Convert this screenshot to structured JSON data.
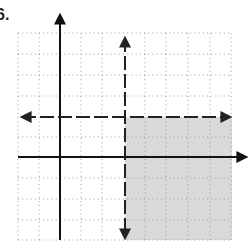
{
  "problem": {
    "label": "6."
  },
  "graph": {
    "type": "inequality-graph",
    "description": "System of linear inequalities on coordinate grid with shaded solution region",
    "grid": {
      "x_min": -2,
      "x_max": 8,
      "y_min": -4,
      "y_max": 6,
      "unit_px": 21,
      "dot_color": "#9a9a9a"
    },
    "axes": {
      "x_axis_y": 0,
      "y_axis_x": 0,
      "color": "#111111"
    },
    "boundary_lines": [
      {
        "name": "vertical-boundary",
        "equation": "x = 3",
        "style": "dashed"
      },
      {
        "name": "horizontal-boundary",
        "equation": "y = 2",
        "style": "dashed"
      }
    ],
    "shaded_region": {
      "inequalities": [
        "x > 3",
        "y < 2"
      ],
      "color": "#d9d9d9"
    }
  }
}
